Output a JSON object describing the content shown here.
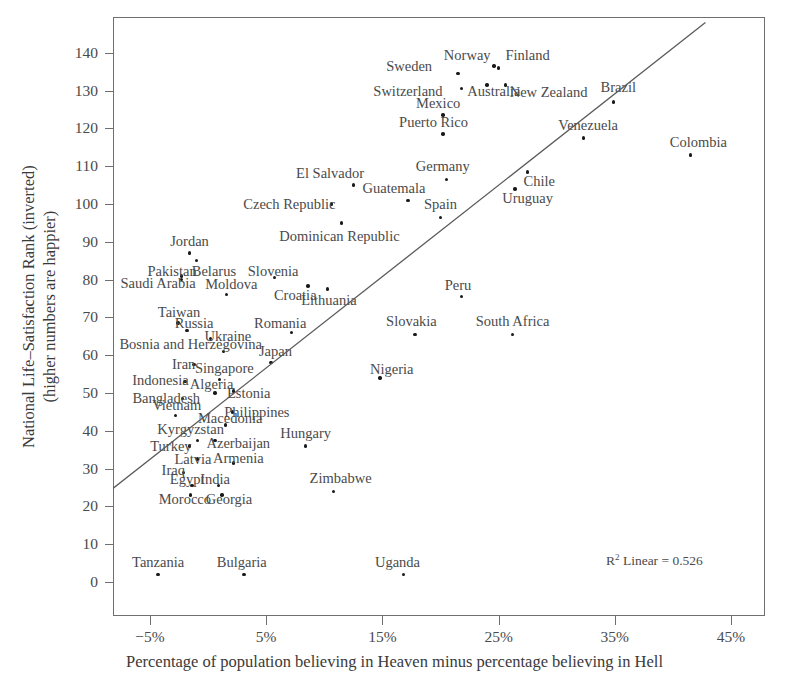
{
  "chart_data": {
    "type": "scatter",
    "title": "",
    "xlabel": "Percentage of population believing in Heaven minus percentage believing in Hell",
    "ylabel_line1": "National Life–Satisfaction Rank (inverted)",
    "ylabel_line2": "(higher numbers are happier)",
    "xlim": [
      -8.5,
      48.5
    ],
    "ylim": [
      -3,
      149
    ],
    "xticks": [
      -5,
      5,
      15,
      25,
      35,
      45
    ],
    "xticklabels": [
      "−5%",
      "5%",
      "15%",
      "25%",
      "35%",
      "45%"
    ],
    "yticks": [
      0,
      10,
      20,
      30,
      40,
      50,
      60,
      70,
      80,
      90,
      100,
      110,
      120,
      130,
      140
    ],
    "yticklabels": [
      "0",
      "10",
      "20",
      "30",
      "40",
      "50",
      "60",
      "70",
      "80",
      "90",
      "100",
      "110",
      "120",
      "130",
      "140"
    ],
    "grid": false,
    "legend": null,
    "annotation": "R² Linear = 0.526",
    "annotation_r2_value": 0.526,
    "trendline": {
      "type": "linear",
      "x_start": -8.5,
      "y_start": 24,
      "x_end": 42.8,
      "y_end": 148
    },
    "points": [
      {
        "label": "Sweden",
        "x": 21.5,
        "y": 134.5,
        "lx": 17.3,
        "ly": 136.5
      },
      {
        "label": "Norway",
        "x": 24.6,
        "y": 136.5,
        "lx": 22.3,
        "ly": 139.5
      },
      {
        "label": "Finland",
        "x": 25.0,
        "y": 136.0,
        "lx": 27.5,
        "ly": 139.5
      },
      {
        "label": "Switzerland",
        "x": 21.8,
        "y": 130.5,
        "lx": 17.2,
        "ly": 129.8
      },
      {
        "label": "Australia",
        "x": 24.0,
        "y": 131.5,
        "lx": 24.6,
        "ly": 129.8
      },
      {
        "label": "New Zealand",
        "x": 25.6,
        "y": 131.5,
        "lx": 29.3,
        "ly": 129.5
      },
      {
        "label": "Brazil",
        "x": 34.9,
        "y": 127.0,
        "lx": 35.3,
        "ly": 131.0
      },
      {
        "label": "Mexico",
        "x": 20.2,
        "y": 123.5,
        "lx": 19.8,
        "ly": 126.8
      },
      {
        "label": "Puerto Rico",
        "x": 20.2,
        "y": 118.5,
        "lx": 19.4,
        "ly": 121.8
      },
      {
        "label": "Venezuela",
        "x": 32.3,
        "y": 117.5,
        "lx": 32.7,
        "ly": 121.0
      },
      {
        "label": "Colombia",
        "x": 41.5,
        "y": 113.0,
        "lx": 42.2,
        "ly": 116.5
      },
      {
        "label": "El Salvador",
        "x": 12.5,
        "y": 105.0,
        "lx": 10.5,
        "ly": 108.2
      },
      {
        "label": "Germany",
        "x": 20.5,
        "y": 106.5,
        "lx": 20.2,
        "ly": 110.0
      },
      {
        "label": "Chile",
        "x": 27.5,
        "y": 108.5,
        "lx": 28.5,
        "ly": 106.0
      },
      {
        "label": "Guatemala",
        "x": 17.2,
        "y": 101.0,
        "lx": 16.0,
        "ly": 104.3
      },
      {
        "label": "Uruguay",
        "x": 26.4,
        "y": 104.0,
        "lx": 27.5,
        "ly": 101.5
      },
      {
        "label": "Czech Republic",
        "x": 10.6,
        "y": 100.0,
        "lx": 7.0,
        "ly": 100.0
      },
      {
        "label": "Spain",
        "x": 20.0,
        "y": 96.5,
        "lx": 20.0,
        "ly": 100.0
      },
      {
        "label": "Dominican Republic",
        "x": 11.5,
        "y": 95.0,
        "lx": 11.3,
        "ly": 91.5
      },
      {
        "label": "Jordan",
        "x": -1.6,
        "y": 87.0,
        "lx": -1.6,
        "ly": 90.2
      },
      {
        "label": "Belarus",
        "x": -1.0,
        "y": 85.0,
        "lx": 0.5,
        "ly": 82.3
      },
      {
        "label": "Pakistan",
        "x": -2.3,
        "y": 81.0,
        "lx": -3.1,
        "ly": 82.3
      },
      {
        "label": "Slovenia",
        "x": 5.7,
        "y": 80.5,
        "lx": 5.6,
        "ly": 82.3
      },
      {
        "label": "Saudi Arabia",
        "x": -2.3,
        "y": 80.0,
        "lx": -4.3,
        "ly": 79.0
      },
      {
        "label": "Croatia",
        "x": 8.6,
        "y": 78.3,
        "lx": 7.5,
        "ly": 75.8
      },
      {
        "label": "Moldova",
        "x": 1.6,
        "y": 76.0,
        "lx": 2.0,
        "ly": 78.8
      },
      {
        "label": "Peru",
        "x": 21.8,
        "y": 75.5,
        "lx": 21.5,
        "ly": 78.5
      },
      {
        "label": "Lithuania",
        "x": 10.3,
        "y": 77.5,
        "lx": 10.4,
        "ly": 74.5
      },
      {
        "label": "Taiwan",
        "x": -2.6,
        "y": 68.5,
        "lx": -2.5,
        "ly": 71.5
      },
      {
        "label": "Russia",
        "x": -1.8,
        "y": 66.5,
        "lx": -1.2,
        "ly": 68.5
      },
      {
        "label": "Romania",
        "x": 7.2,
        "y": 66.0,
        "lx": 6.2,
        "ly": 68.5
      },
      {
        "label": "Slovakia",
        "x": 17.8,
        "y": 65.5,
        "lx": 17.5,
        "ly": 69.0
      },
      {
        "label": "South Africa",
        "x": 26.2,
        "y": 65.5,
        "lx": 26.2,
        "ly": 69.0
      },
      {
        "label": "Ukraine",
        "x": 0.2,
        "y": 64.5,
        "lx": 1.7,
        "ly": 65.0
      },
      {
        "label": "Bosnia and Herzegovina",
        "x": 1.3,
        "y": 61.0,
        "lx": -1.5,
        "ly": 63.0
      },
      {
        "label": "Japan",
        "x": 5.4,
        "y": 58.0,
        "lx": 5.8,
        "ly": 61.0
      },
      {
        "label": "Iran",
        "x": -1.2,
        "y": 57.5,
        "lx": -2.1,
        "ly": 57.8
      },
      {
        "label": "Nigeria",
        "x": 14.8,
        "y": 54.0,
        "lx": 15.8,
        "ly": 56.3
      },
      {
        "label": "Singapore",
        "x": 1.0,
        "y": 53.5,
        "lx": 1.4,
        "ly": 56.5
      },
      {
        "label": "Indonesia",
        "x": -2.0,
        "y": 53.0,
        "lx": -4.1,
        "ly": 53.5
      },
      {
        "label": "Algeria",
        "x": 0.6,
        "y": 50.0,
        "lx": 0.3,
        "ly": 52.5
      },
      {
        "label": "Estonia",
        "x": 2.2,
        "y": 50.5,
        "lx": 3.5,
        "ly": 50.0
      },
      {
        "label": "Bangladesh",
        "x": -2.2,
        "y": 48.5,
        "lx": -3.6,
        "ly": 48.8
      },
      {
        "label": "Vietnam",
        "x": -2.8,
        "y": 44.0,
        "lx": -2.7,
        "ly": 46.8
      },
      {
        "label": "Philippines",
        "x": 2.1,
        "y": 45.0,
        "lx": 4.2,
        "ly": 45.0
      },
      {
        "label": "Macedonia",
        "x": 1.5,
        "y": 41.5,
        "lx": 1.9,
        "ly": 43.5
      },
      {
        "label": "Kyrgyzstan",
        "x": -0.9,
        "y": 37.5,
        "lx": -1.5,
        "ly": 40.5
      },
      {
        "label": "Hungary",
        "x": 8.4,
        "y": 36.0,
        "lx": 8.4,
        "ly": 39.5
      },
      {
        "label": "Azerbaijan",
        "x": 0.6,
        "y": 37.5,
        "lx": 2.6,
        "ly": 36.8
      },
      {
        "label": "Turkey",
        "x": -1.6,
        "y": 36.0,
        "lx": -3.2,
        "ly": 36.0
      },
      {
        "label": "Latvia",
        "x": -0.9,
        "y": 32.5,
        "lx": -1.3,
        "ly": 32.5
      },
      {
        "label": "Armenia",
        "x": 2.2,
        "y": 31.5,
        "lx": 2.6,
        "ly": 32.8
      },
      {
        "label": "Iraq",
        "x": -2.1,
        "y": 29.0,
        "lx": -3.0,
        "ly": 29.5
      },
      {
        "label": "Egypt",
        "x": -1.4,
        "y": 25.5,
        "lx": -1.8,
        "ly": 27.3
      },
      {
        "label": "India",
        "x": 0.9,
        "y": 25.5,
        "lx": 0.6,
        "ly": 27.3
      },
      {
        "label": "Zimbabwe",
        "x": 10.8,
        "y": 24.0,
        "lx": 11.4,
        "ly": 27.5
      },
      {
        "label": "Morocco",
        "x": -1.5,
        "y": 23.0,
        "lx": -2.0,
        "ly": 22.0
      },
      {
        "label": "Georgia",
        "x": 1.2,
        "y": 23.0,
        "lx": 1.8,
        "ly": 22.0
      },
      {
        "label": "Tanzania",
        "x": -4.3,
        "y": 2.0,
        "lx": -4.3,
        "ly": 5.3
      },
      {
        "label": "Bulgaria",
        "x": 3.1,
        "y": 2.0,
        "lx": 2.9,
        "ly": 5.3
      },
      {
        "label": "Uganda",
        "x": 16.8,
        "y": 2.0,
        "lx": 16.3,
        "ly": 5.3
      }
    ]
  }
}
